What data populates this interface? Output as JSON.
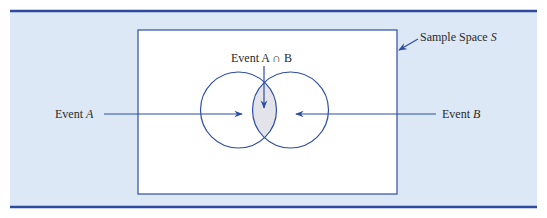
{
  "figure": {
    "colors": {
      "band": "#dde8f6",
      "border": "#2b4aa0",
      "line": "#2d4ea3",
      "rect_fill": "#ffffff",
      "intersection_fill": "#e2e4ea",
      "text": "#2a2a2a"
    },
    "labels": {
      "sample_space_prefix": "Sample Space ",
      "sample_space_symbol": "S",
      "intersection": "Event A ∩ B",
      "event_a_prefix": "Event ",
      "event_a_symbol": "A",
      "event_b_prefix": "Event ",
      "event_b_symbol": "B"
    }
  }
}
